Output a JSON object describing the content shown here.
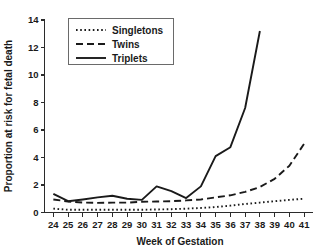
{
  "chart_data": {
    "type": "line",
    "title": "",
    "subtitle": "",
    "xlabel": "Week of Gestation",
    "ylabel": "Proportion at risk for fetal death",
    "x": [
      24,
      25,
      26,
      27,
      28,
      29,
      30,
      31,
      32,
      33,
      34,
      35,
      36,
      37,
      38,
      39,
      40,
      41
    ],
    "xtick_labels": [
      "24",
      "25",
      "26",
      "27",
      "28",
      "29",
      "30",
      "31",
      "32",
      "33",
      "34",
      "35",
      "36",
      "37",
      "38",
      "39",
      "40",
      "41"
    ],
    "ytick_labels": [
      "0",
      "2",
      "4",
      "6",
      "8",
      "10",
      "12",
      "14"
    ],
    "yticks": [
      0,
      2,
      4,
      6,
      8,
      10,
      12,
      14
    ],
    "xlim": [
      23.4,
      41.6
    ],
    "ylim": [
      0,
      14
    ],
    "grid": false,
    "legend_position": "top-left-inside",
    "series": [
      {
        "name": "Singletons",
        "style": "dotted",
        "color": "#1a1a1a",
        "x": [
          24,
          25,
          26,
          27,
          28,
          29,
          30,
          31,
          32,
          33,
          34,
          35,
          36,
          37,
          38,
          39,
          40,
          41
        ],
        "values": [
          0.28,
          0.2,
          0.2,
          0.2,
          0.2,
          0.2,
          0.2,
          0.22,
          0.24,
          0.28,
          0.33,
          0.4,
          0.5,
          0.62,
          0.72,
          0.82,
          0.92,
          1.0
        ]
      },
      {
        "name": "Twins",
        "style": "dashed",
        "color": "#1a1a1a",
        "x": [
          24,
          25,
          26,
          27,
          28,
          29,
          30,
          31,
          32,
          33,
          34,
          35,
          36,
          37,
          38,
          39,
          40,
          41
        ],
        "values": [
          0.95,
          0.8,
          0.72,
          0.7,
          0.72,
          0.72,
          0.78,
          0.8,
          0.82,
          0.88,
          0.95,
          1.1,
          1.25,
          1.5,
          1.85,
          2.45,
          3.4,
          5.0
        ]
      },
      {
        "name": "Triplets",
        "style": "solid",
        "color": "#1a1a1a",
        "x": [
          24,
          25,
          26,
          27,
          28,
          29,
          30,
          31,
          32,
          33,
          34,
          35,
          36,
          37,
          38
        ],
        "values": [
          1.35,
          0.82,
          0.95,
          1.1,
          1.22,
          1.0,
          0.92,
          1.9,
          1.55,
          1.05,
          1.9,
          4.1,
          4.75,
          7.6,
          13.2
        ]
      }
    ]
  },
  "legend": {
    "entries": [
      {
        "label": "Singletons",
        "style": "dotted"
      },
      {
        "label": "Twins",
        "style": "dashed"
      },
      {
        "label": "Triplets",
        "style": "solid"
      }
    ]
  }
}
